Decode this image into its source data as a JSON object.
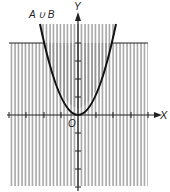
{
  "diagram": {
    "title_label": "A ∪ B",
    "axis_x_label": "X",
    "axis_y_label": "Y",
    "origin_label": "O",
    "colors": {
      "hatch": "#8a8a8a",
      "curve": "#111111",
      "axis": "#222222",
      "background": "#ffffff"
    }
  }
}
